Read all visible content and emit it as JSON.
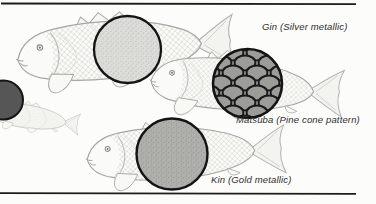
{
  "figure": {
    "labels": {
      "gin": "Gin (Silver metallic)",
      "matsuba": "Matsuba (Pine cone pattern)",
      "kin": "Kin (Gold metallic)"
    },
    "colors": {
      "background": "#fcfcfa",
      "rule": "#1c1c1c",
      "circle_outline": "#141414",
      "gin_fill_base": "#dcdcd8",
      "gin_fill_dot": "#b6b6b2",
      "kin_fill_base": "#b0b0ac",
      "kin_fill_dot": "#8e8e8a",
      "matsuba_bg": "#f2f2ee",
      "matsuba_cell": "#9c9c98",
      "matsuba_line": "#1a1a1a",
      "partial_circle_fill": "#565656",
      "fish_outline": "#a6a6a2",
      "label_text": "#2e2e2e"
    }
  }
}
